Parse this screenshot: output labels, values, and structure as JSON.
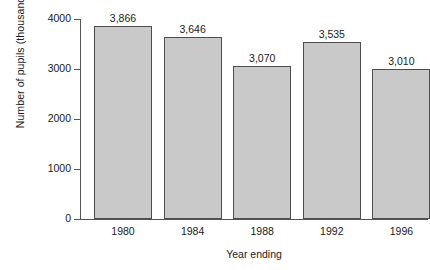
{
  "chart_data": {
    "type": "bar",
    "title": "",
    "subtitle": "",
    "xlabel": "Year ending",
    "ylabel": "Number of pupils (thousands)",
    "categories": [
      "1980",
      "1984",
      "1988",
      "1992",
      "1996"
    ],
    "values": [
      3866,
      3646,
      3070,
      3535,
      3010
    ],
    "value_labels": [
      "3,866",
      "3,646",
      "3,070",
      "3,535",
      "3,010"
    ],
    "ylim": [
      0,
      4000
    ],
    "yticks": [
      0,
      1000,
      2000,
      3000,
      4000
    ],
    "ytick_labels": [
      "0",
      "1000",
      "2000",
      "3000",
      "4000"
    ],
    "grid": false,
    "legend": false,
    "legend_position": "none",
    "colors": {
      "bar_fill": "#c9c9c9",
      "bar_edge": "#4d4d4d",
      "axis": "#555555",
      "text": "#1a1a1a",
      "background": "#ffffff"
    }
  }
}
